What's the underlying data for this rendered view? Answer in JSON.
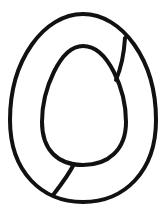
{
  "figure": {
    "label": "Egg-shaped ring line drawing",
    "stroke_color": "#111111",
    "background": "#ffffff",
    "stroke_width": 4
  }
}
